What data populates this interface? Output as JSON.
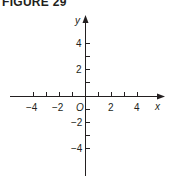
{
  "figure": {
    "title": "FIGURE 29",
    "axes": {
      "x_label": "x",
      "y_label": "y",
      "origin_label": "O",
      "x_tick_labels": [
        "−4",
        "−2",
        "2",
        "4"
      ],
      "y_tick_labels": [
        "4",
        "2",
        "−2",
        "−4"
      ],
      "x_range": [
        -6,
        6
      ],
      "y_range": [
        -6,
        6
      ],
      "tick_spacing": 1,
      "label_spacing": 2
    },
    "colors": {
      "axis": "#231f20",
      "background": "#ffffff"
    }
  }
}
